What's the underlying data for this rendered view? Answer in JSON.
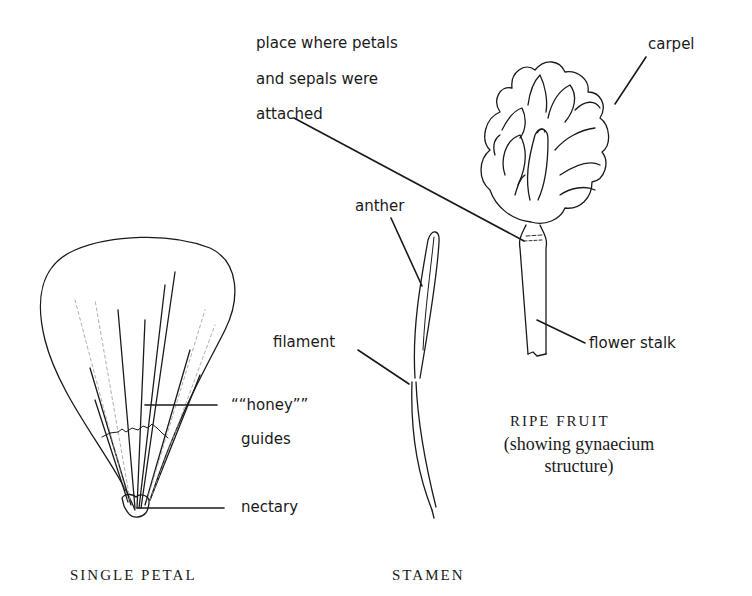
{
  "diagram": {
    "labels": {
      "place_line1": "place where petals",
      "place_line2": "and sepals were",
      "place_line3": "attached",
      "carpel": "carpel",
      "anther": "anther",
      "filament": "filament",
      "flower_stalk": "flower stalk",
      "honey": "““honey””",
      "guides": "guides",
      "nectary": "nectary"
    },
    "captions": {
      "single_petal": "SINGLE PETAL",
      "stamen": "STAMEN",
      "ripe_fruit": "RIPE FRUIT",
      "ripe_fruit_sub1": "(showing gynaecium",
      "ripe_fruit_sub2": "structure)"
    },
    "colors": {
      "ink": "#1a1a1a",
      "paper": "#ffffff",
      "faint_ink": "#8a8a8a"
    }
  }
}
